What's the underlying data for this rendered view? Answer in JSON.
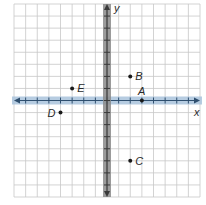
{
  "chart_data": {
    "type": "scatter",
    "title": "",
    "xlabel": "x",
    "ylabel": "y",
    "xlim": [
      -8,
      8
    ],
    "ylim": [
      -8,
      8
    ],
    "grid": true,
    "tick_labels_shown": false,
    "points": [
      {
        "label": "A",
        "x": 3,
        "y": 0
      },
      {
        "label": "B",
        "x": 2,
        "y": 2
      },
      {
        "label": "C",
        "x": 2,
        "y": -5
      },
      {
        "label": "D",
        "x": -4,
        "y": -1
      },
      {
        "label": "E",
        "x": -3,
        "y": 1
      }
    ]
  },
  "axes": {
    "x_label": "x",
    "y_label": "y"
  },
  "colors": {
    "grid": "#c8c8c8",
    "x_axis_band": "#a9c3dc",
    "x_axis_line": "#2f4f6f",
    "y_axis_band": "#8a8a8a",
    "y_axis_line": "#3a3a3a",
    "point": "#1a1a1a"
  }
}
